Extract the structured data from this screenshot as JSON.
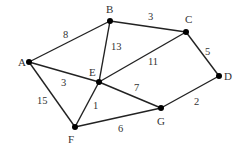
{
  "diagram": {
    "type": "weighted-undirected-graph",
    "colors": {
      "edge": "#222222",
      "node": "#000000",
      "text": "#333333",
      "background": "#ffffff"
    },
    "nodes": [
      {
        "id": "A",
        "label": "A",
        "x": 29,
        "y": 62,
        "lx": 18,
        "ly": 66
      },
      {
        "id": "B",
        "label": "B",
        "x": 110,
        "y": 21,
        "lx": 106,
        "ly": 13
      },
      {
        "id": "C",
        "label": "C",
        "x": 186,
        "y": 32,
        "lx": 185,
        "ly": 23
      },
      {
        "id": "D",
        "label": "D",
        "x": 219,
        "y": 76,
        "lx": 224,
        "ly": 80
      },
      {
        "id": "E",
        "label": "E",
        "x": 99,
        "y": 82,
        "lx": 89,
        "ly": 76
      },
      {
        "id": "F",
        "label": "F",
        "x": 75,
        "y": 127,
        "lx": 68,
        "ly": 143
      },
      {
        "id": "G",
        "label": "G",
        "x": 161,
        "y": 108,
        "lx": 157,
        "ly": 125
      }
    ],
    "edges": [
      {
        "from": "A",
        "to": "B",
        "weight": "8",
        "wx": 63,
        "wy": 38
      },
      {
        "from": "B",
        "to": "C",
        "weight": "3",
        "wx": 148,
        "wy": 20
      },
      {
        "from": "B",
        "to": "E",
        "weight": "13",
        "wx": 111,
        "wy": 50
      },
      {
        "from": "C",
        "to": "E",
        "weight": "11",
        "wx": 148,
        "wy": 65
      },
      {
        "from": "C",
        "to": "D",
        "weight": "5",
        "wx": 205,
        "wy": 55
      },
      {
        "from": "A",
        "to": "E",
        "weight": "3",
        "wx": 61,
        "wy": 86
      },
      {
        "from": "E",
        "to": "G",
        "weight": "7",
        "wx": 134,
        "wy": 91
      },
      {
        "from": "A",
        "to": "F",
        "weight": "15",
        "wx": 37,
        "wy": 104
      },
      {
        "from": "E",
        "to": "F",
        "weight": "1",
        "wx": 93,
        "wy": 109
      },
      {
        "from": "G",
        "to": "D",
        "weight": "2",
        "wx": 194,
        "wy": 105
      },
      {
        "from": "F",
        "to": "G",
        "weight": "6",
        "wx": 118,
        "wy": 132
      }
    ]
  }
}
